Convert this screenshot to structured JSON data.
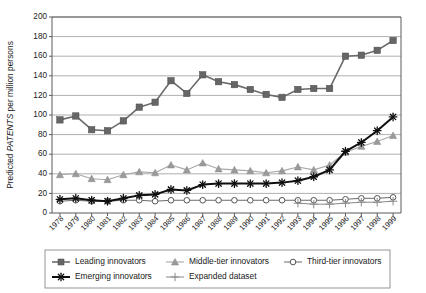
{
  "chart_data": {
    "type": "line",
    "title": "",
    "xlabel": "",
    "ylabel": "Predicted PATENTS per million persons",
    "ylabel_plain": "Predicted ",
    "ylabel_italic": "PATENTS",
    "ylabel_tail": " per million persons",
    "ylim": [
      0,
      200
    ],
    "ytick_step": 20,
    "grid": true,
    "legend_position": "bottom",
    "yticks": [
      "0",
      "20",
      "40",
      "60",
      "80",
      "100",
      "120",
      "140",
      "160",
      "180",
      "200"
    ],
    "categories": [
      "1978",
      "1979",
      "1980",
      "1981",
      "1982",
      "1983",
      "1984",
      "1985",
      "1986",
      "1987",
      "1988",
      "1989",
      "1990",
      "1991",
      "1992",
      "1993",
      "1994",
      "1995",
      "1996",
      "1997",
      "1998",
      "1999"
    ],
    "series": [
      {
        "name": "Leading innovators",
        "marker": "filled-square",
        "color": "#666666",
        "line_color": "#6b6b6b",
        "line_width": 1.6,
        "values": [
          95,
          99,
          85,
          84,
          94,
          108,
          113,
          135,
          122,
          141,
          134,
          131,
          126,
          121,
          118,
          126,
          127,
          127,
          160,
          161,
          166,
          176
        ]
      },
      {
        "name": "Middle-tier innovators",
        "marker": "filled-triangle",
        "color": "#9a9a9a",
        "line_color": "#a8a8a8",
        "line_width": 1.1,
        "values": [
          39,
          40,
          35,
          34,
          39,
          42,
          41,
          49,
          44,
          51,
          45,
          44,
          43,
          41,
          43,
          47,
          44,
          49,
          62,
          68,
          73,
          79
        ]
      },
      {
        "name": "Third-tier innovators",
        "marker": "open-circle",
        "color": "#555555",
        "line_color": "#6b6b6b",
        "line_width": 1.0,
        "values": [
          12,
          13,
          12,
          12,
          13,
          13,
          12,
          13,
          13,
          13,
          13,
          13,
          13,
          13,
          13,
          13,
          13,
          13,
          14,
          15,
          15,
          16
        ]
      },
      {
        "name": "Emerging innovators",
        "marker": "asterisk",
        "color": "#101010",
        "line_color": "#101010",
        "line_width": 2.0,
        "values": [
          14,
          15,
          13,
          12,
          15,
          18,
          19,
          24,
          23,
          29,
          30,
          30,
          30,
          30,
          31,
          33,
          37,
          44,
          63,
          72,
          84,
          98
        ]
      },
      {
        "name": "Expanded dataset",
        "marker": "plus",
        "color": "#8a8a8a",
        "line_color": "#8a8a8a",
        "line_width": 1.0,
        "start_category": "1993",
        "values": [
          null,
          null,
          null,
          null,
          null,
          null,
          null,
          null,
          null,
          null,
          null,
          null,
          null,
          null,
          null,
          10,
          9,
          9,
          10,
          11,
          11,
          12
        ]
      }
    ]
  },
  "legend": {
    "entries": [
      {
        "label": "Leading innovators",
        "marker": "filled-square"
      },
      {
        "label": "Middle-tier innovators",
        "marker": "filled-triangle"
      },
      {
        "label": "Third-tier innovators",
        "marker": "open-circle"
      },
      {
        "label": "Emerging innovators",
        "marker": "asterisk"
      },
      {
        "label": "Expanded dataset",
        "marker": "plus"
      }
    ]
  }
}
